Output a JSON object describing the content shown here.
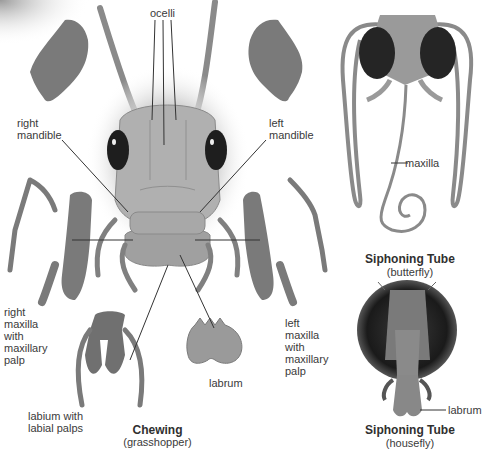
{
  "diagram": {
    "colors": {
      "part": "#7a7a7a",
      "part_dark": "#5e5e5e",
      "head": "#a9a9a9",
      "head_light": "#c4c4c4",
      "eye": "#1e1e1e",
      "leader_line": "#333333",
      "text": "#3a3a3a"
    },
    "grasshopper": {
      "caption_title": "Chewing",
      "caption_sub": "(grasshopper)",
      "labels": {
        "ocelli": "ocelli",
        "right_mandible": "right\nmandible",
        "left_mandible": "left\nmandible",
        "right_maxilla": "right\nmaxilla\nwith\nmaxillary\npalp",
        "left_maxilla": "left\nmaxilla\nwith\nmaxillary\npalp",
        "labrum": "labrum",
        "labium": "labium with\nlabial palps"
      }
    },
    "butterfly": {
      "caption_title": "Siphoning Tube",
      "caption_sub": "(butterfly)",
      "labels": {
        "maxilla": "maxilla"
      }
    },
    "housefly": {
      "caption_title": "Siphoning Tube",
      "caption_sub": "(housefly)",
      "labels": {
        "labrum": "labrum"
      }
    }
  }
}
